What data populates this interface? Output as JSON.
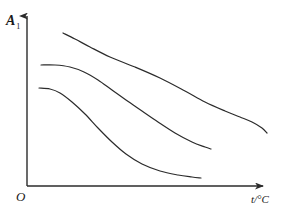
{
  "figure": {
    "background_color": "#ffffff",
    "ink_color": "#2b2b2b",
    "width": 285,
    "height": 211
  },
  "axes": {
    "y_label": "A",
    "y_label_subscript": "1",
    "x_label": "t/°C",
    "origin_label": "O",
    "y_axis_name": "y-axis",
    "x_axis_name": "x-axis"
  },
  "chart_data": {
    "type": "line",
    "title": "",
    "xlabel": "t/°C",
    "ylabel": "A₁",
    "xlim": [
      0,
      100
    ],
    "ylim": [
      0,
      100
    ],
    "grid": false,
    "legend": "none",
    "axis_arrows": true,
    "tick_labels": [],
    "annotations": [],
    "series": [
      {
        "name": "curve-1-top",
        "points": [
          [
            63,
            33
          ],
          [
            75,
            39
          ],
          [
            90,
            47
          ],
          [
            110,
            57
          ],
          [
            135,
            67
          ],
          [
            160,
            78
          ],
          [
            185,
            91
          ],
          [
            205,
            102
          ],
          [
            225,
            111
          ],
          [
            240,
            117
          ],
          [
            252,
            122
          ],
          [
            262,
            128
          ],
          [
            267,
            133
          ]
        ]
      },
      {
        "name": "curve-2-middle",
        "points": [
          [
            41,
            65
          ],
          [
            55,
            65
          ],
          [
            70,
            67
          ],
          [
            84,
            72
          ],
          [
            98,
            80
          ],
          [
            112,
            90
          ],
          [
            126,
            100
          ],
          [
            142,
            111
          ],
          [
            158,
            122
          ],
          [
            175,
            133
          ],
          [
            192,
            142
          ],
          [
            205,
            147
          ],
          [
            211,
            149
          ]
        ]
      },
      {
        "name": "curve-3-bottom",
        "points": [
          [
            39,
            88
          ],
          [
            50,
            89
          ],
          [
            60,
            93
          ],
          [
            72,
            102
          ],
          [
            85,
            114
          ],
          [
            98,
            128
          ],
          [
            112,
            142
          ],
          [
            126,
            154
          ],
          [
            142,
            164
          ],
          [
            160,
            171
          ],
          [
            178,
            175
          ],
          [
            192,
            177
          ],
          [
            201,
            178
          ]
        ]
      }
    ]
  }
}
